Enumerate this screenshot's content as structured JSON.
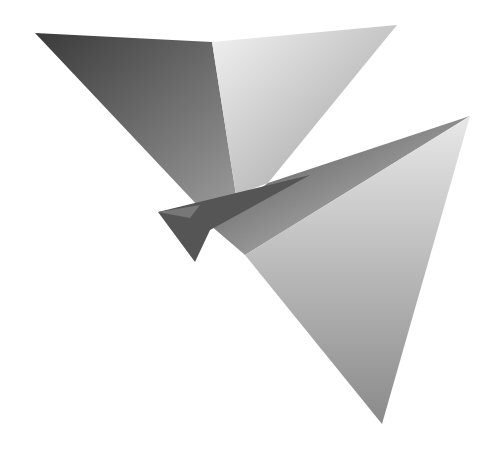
{
  "image": {
    "subject": "origami butterfly",
    "style": "grayscale photograph",
    "background": "#ffffff",
    "colors": {
      "dark": "#3a3a3a",
      "mid": "#8a8a8a",
      "light": "#e6e6e6"
    }
  }
}
